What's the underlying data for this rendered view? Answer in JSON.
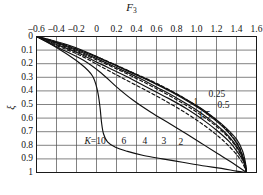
{
  "chart_data": {
    "type": "line",
    "title": "",
    "xlabel": "F3",
    "xlabel_display": "F",
    "xlabel_sub": "3",
    "ylabel": "ξ",
    "xlim": [
      -0.6,
      1.6
    ],
    "ylim": [
      0,
      1
    ],
    "y_inverted": true,
    "grid": true,
    "grid_x_step": 0.2,
    "grid_y_step": 0.1,
    "xticks": [
      "–0.6",
      "–0.4",
      "–0.2",
      "0",
      "0.2",
      "0.4",
      "0.6",
      "0.8",
      "1.0",
      "1.2",
      "1.4",
      "1.6"
    ],
    "xtick_values": [
      -0.6,
      -0.4,
      -0.2,
      0,
      0.2,
      0.4,
      0.6,
      0.8,
      1.0,
      1.2,
      1.4,
      1.6
    ],
    "yticks": [
      "0",
      "0.1",
      "0.2",
      "0.3",
      "0.4",
      "0.5",
      "0.6",
      "0.7",
      "0.8",
      "0.9",
      "1"
    ],
    "ytick_values": [
      0,
      0.1,
      0.2,
      0.3,
      0.4,
      0.5,
      0.6,
      0.7,
      0.8,
      0.9,
      1.0
    ],
    "legend_position": "inline-curve-labels",
    "start_point": [
      -0.6,
      0
    ],
    "convergence_point": [
      1.5,
      1
    ],
    "curve_param_symbol": "K",
    "series": [
      {
        "name": "0.25",
        "label": "0.25",
        "style": "solid",
        "label_pos": [
          1.12,
          0.425
        ],
        "points": [
          [
            -0.6,
            0
          ],
          [
            -0.48,
            0.02
          ],
          [
            -0.34,
            0.05
          ],
          [
            -0.18,
            0.09
          ],
          [
            -0.02,
            0.14
          ],
          [
            0.16,
            0.2
          ],
          [
            0.34,
            0.26
          ],
          [
            0.52,
            0.32
          ],
          [
            0.7,
            0.385
          ],
          [
            0.88,
            0.455
          ],
          [
            1.04,
            0.525
          ],
          [
            1.18,
            0.6
          ],
          [
            1.3,
            0.675
          ],
          [
            1.4,
            0.755
          ],
          [
            1.46,
            0.84
          ],
          [
            1.49,
            0.93
          ],
          [
            1.5,
            1.0
          ]
        ]
      },
      {
        "name": "0.5",
        "label": "0.5",
        "style": "dashed",
        "label_pos": [
          1.21,
          0.5
        ],
        "points": [
          [
            -0.6,
            0
          ],
          [
            -0.47,
            0.025
          ],
          [
            -0.32,
            0.06
          ],
          [
            -0.15,
            0.105
          ],
          [
            0.04,
            0.16
          ],
          [
            0.24,
            0.225
          ],
          [
            0.44,
            0.29
          ],
          [
            0.63,
            0.355
          ],
          [
            0.81,
            0.425
          ],
          [
            0.98,
            0.5
          ],
          [
            1.13,
            0.575
          ],
          [
            1.26,
            0.655
          ],
          [
            1.36,
            0.735
          ],
          [
            1.43,
            0.815
          ],
          [
            1.47,
            0.9
          ],
          [
            1.495,
            0.96
          ],
          [
            1.5,
            1.0
          ]
        ]
      },
      {
        "name": "1",
        "label": "1",
        "style": "solid",
        "label_pos": [
          0.97,
          0.485
        ],
        "points": [
          [
            -0.6,
            0
          ],
          [
            -0.46,
            0.03
          ],
          [
            -0.29,
            0.07
          ],
          [
            -0.09,
            0.125
          ],
          [
            0.12,
            0.19
          ],
          [
            0.33,
            0.26
          ],
          [
            0.54,
            0.33
          ],
          [
            0.74,
            0.405
          ],
          [
            0.92,
            0.48
          ],
          [
            1.08,
            0.555
          ],
          [
            1.22,
            0.635
          ],
          [
            1.33,
            0.715
          ],
          [
            1.41,
            0.795
          ],
          [
            1.46,
            0.875
          ],
          [
            1.49,
            0.945
          ],
          [
            1.5,
            1.0
          ]
        ]
      },
      {
        "name": "1.5",
        "label": "1.5",
        "style": "solid",
        "label_pos": [
          1.02,
          0.575
        ],
        "points": [
          [
            -0.6,
            0
          ],
          [
            -0.45,
            0.035
          ],
          [
            -0.26,
            0.085
          ],
          [
            -0.04,
            0.15
          ],
          [
            0.19,
            0.225
          ],
          [
            0.41,
            0.3
          ],
          [
            0.62,
            0.38
          ],
          [
            0.81,
            0.455
          ],
          [
            0.99,
            0.535
          ],
          [
            1.14,
            0.615
          ],
          [
            1.27,
            0.695
          ],
          [
            1.37,
            0.775
          ],
          [
            1.44,
            0.855
          ],
          [
            1.48,
            0.93
          ],
          [
            1.5,
            1.0
          ]
        ]
      },
      {
        "name": "2",
        "label": "2",
        "style": "dashed",
        "label_pos": [
          0.82,
          0.775
        ],
        "points": [
          [
            -0.6,
            0
          ],
          [
            -0.44,
            0.04
          ],
          [
            -0.23,
            0.1
          ],
          [
            0.01,
            0.175
          ],
          [
            0.25,
            0.255
          ],
          [
            0.47,
            0.335
          ],
          [
            0.68,
            0.415
          ],
          [
            0.87,
            0.495
          ],
          [
            1.04,
            0.575
          ],
          [
            1.19,
            0.655
          ],
          [
            1.31,
            0.735
          ],
          [
            1.4,
            0.815
          ],
          [
            1.46,
            0.895
          ],
          [
            1.49,
            0.96
          ],
          [
            1.5,
            1.0
          ]
        ]
      },
      {
        "name": "3",
        "label": "3",
        "style": "solid",
        "label_pos": [
          0.65,
          0.765
        ],
        "points": [
          [
            -0.6,
            0
          ],
          [
            -0.43,
            0.05
          ],
          [
            -0.19,
            0.12
          ],
          [
            0.05,
            0.205
          ],
          [
            0.29,
            0.29
          ],
          [
            0.51,
            0.375
          ],
          [
            0.72,
            0.455
          ],
          [
            0.91,
            0.535
          ],
          [
            1.07,
            0.615
          ],
          [
            1.21,
            0.695
          ],
          [
            1.33,
            0.775
          ],
          [
            1.41,
            0.85
          ],
          [
            1.47,
            0.92
          ],
          [
            1.5,
            1.0
          ]
        ]
      },
      {
        "name": "4",
        "label": "4",
        "style": "dashed",
        "label_pos": [
          0.46,
          0.765
        ],
        "points": [
          [
            -0.6,
            0
          ],
          [
            -0.42,
            0.06
          ],
          [
            -0.16,
            0.14
          ],
          [
            0.08,
            0.235
          ],
          [
            0.31,
            0.325
          ],
          [
            0.53,
            0.41
          ],
          [
            0.74,
            0.495
          ],
          [
            0.92,
            0.575
          ],
          [
            1.08,
            0.655
          ],
          [
            1.22,
            0.735
          ],
          [
            1.33,
            0.81
          ],
          [
            1.42,
            0.885
          ],
          [
            1.47,
            0.945
          ],
          [
            1.5,
            1.0
          ]
        ]
      },
      {
        "name": "6",
        "label": "6",
        "style": "solid",
        "label_pos": [
          0.25,
          0.77
        ],
        "points": [
          [
            -0.6,
            0
          ],
          [
            -0.4,
            0.075
          ],
          [
            -0.13,
            0.175
          ],
          [
            0.05,
            0.27
          ],
          [
            0.2,
            0.37
          ],
          [
            0.36,
            0.465
          ],
          [
            0.54,
            0.555
          ],
          [
            0.73,
            0.64
          ],
          [
            0.91,
            0.72
          ],
          [
            1.07,
            0.795
          ],
          [
            1.21,
            0.86
          ],
          [
            1.33,
            0.915
          ],
          [
            1.42,
            0.96
          ],
          [
            1.5,
            1.0
          ]
        ]
      },
      {
        "name": "10",
        "label": "K=10",
        "style": "solid",
        "label_pos": [
          -0.12,
          0.765
        ],
        "points": [
          [
            -0.6,
            0
          ],
          [
            -0.38,
            0.09
          ],
          [
            -0.16,
            0.2
          ],
          [
            -0.04,
            0.29
          ],
          [
            0.01,
            0.4
          ],
          [
            0.035,
            0.52
          ],
          [
            0.05,
            0.63
          ],
          [
            0.07,
            0.715
          ],
          [
            0.11,
            0.775
          ],
          [
            0.19,
            0.815
          ],
          [
            0.31,
            0.845
          ],
          [
            0.47,
            0.875
          ],
          [
            0.66,
            0.9
          ],
          [
            0.86,
            0.925
          ],
          [
            1.06,
            0.95
          ],
          [
            1.25,
            0.97
          ],
          [
            1.4,
            0.99
          ],
          [
            1.5,
            1.0
          ]
        ]
      }
    ]
  },
  "colors": {
    "axis": "#1a1a1a",
    "grid": "#4d4d4d",
    "curve": "#111111",
    "background": "#ffffff"
  }
}
